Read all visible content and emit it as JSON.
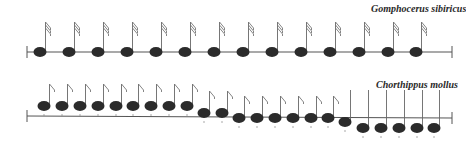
{
  "rows": [
    {
      "species": "Gomphocerus sibiricus",
      "label_pos": {
        "x": 371,
        "y": 3
      },
      "staff": {
        "x1": 27,
        "y1": 52,
        "x2": 452,
        "y2": 52
      },
      "note_style": {
        "flags": 3,
        "stem_height": 30
      },
      "notes": [
        {
          "x": 40,
          "y": 52,
          "flag": true
        },
        {
          "x": 69,
          "y": 52,
          "flag": true
        },
        {
          "x": 98,
          "y": 52,
          "flag": true
        },
        {
          "x": 127,
          "y": 52,
          "flag": true
        },
        {
          "x": 156,
          "y": 52,
          "flag": true
        },
        {
          "x": 185,
          "y": 52,
          "flag": true
        },
        {
          "x": 214,
          "y": 52,
          "flag": true
        },
        {
          "x": 243,
          "y": 52,
          "flag": true
        },
        {
          "x": 272,
          "y": 52,
          "flag": true
        },
        {
          "x": 301,
          "y": 52,
          "flag": true
        },
        {
          "x": 330,
          "y": 52,
          "flag": true
        },
        {
          "x": 359,
          "y": 52,
          "flag": true
        },
        {
          "x": 388,
          "y": 52,
          "flag": true
        },
        {
          "x": 416,
          "y": 52,
          "flag": true
        }
      ]
    },
    {
      "species": "Chorthippus mollus",
      "label_pos": {
        "x": 376,
        "y": 79
      },
      "staff": {
        "x1": 27,
        "y1": 116,
        "x2": 452,
        "y2": 118
      },
      "note_style": {
        "flags": 1,
        "stem_height": 22
      },
      "notes": [
        {
          "x": 44,
          "y": 106,
          "flag": true
        },
        {
          "x": 62,
          "y": 106,
          "flag": true
        },
        {
          "x": 80,
          "y": 106,
          "flag": true
        },
        {
          "x": 98,
          "y": 106,
          "flag": true
        },
        {
          "x": 116,
          "y": 106,
          "flag": true
        },
        {
          "x": 133,
          "y": 106,
          "flag": true
        },
        {
          "x": 151,
          "y": 106,
          "flag": true
        },
        {
          "x": 169,
          "y": 106,
          "flag": true
        },
        {
          "x": 187,
          "y": 106,
          "flag": true
        },
        {
          "x": 204,
          "y": 113,
          "flag": true
        },
        {
          "x": 222,
          "y": 113,
          "flag": true
        },
        {
          "x": 239,
          "y": 118,
          "flag": true
        },
        {
          "x": 257,
          "y": 118,
          "flag": true
        },
        {
          "x": 275,
          "y": 118,
          "flag": true
        },
        {
          "x": 293,
          "y": 118,
          "flag": true
        },
        {
          "x": 311,
          "y": 118,
          "flag": true
        },
        {
          "x": 328,
          "y": 118,
          "flag": true
        },
        {
          "x": 345,
          "y": 122,
          "flag": false
        },
        {
          "x": 363,
          "y": 128,
          "flag": false
        },
        {
          "x": 381,
          "y": 128,
          "flag": false
        },
        {
          "x": 399,
          "y": 128,
          "flag": false
        },
        {
          "x": 417,
          "y": 128,
          "flag": false
        },
        {
          "x": 434,
          "y": 128,
          "flag": false
        }
      ]
    }
  ],
  "colors": {
    "ink": "#2b2b2b",
    "line": "#555555"
  }
}
